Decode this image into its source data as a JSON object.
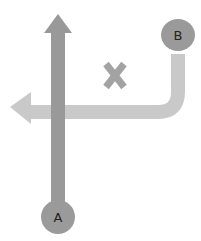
{
  "diagram": {
    "nodes": [
      {
        "id": "A",
        "label": "A",
        "cx": 58,
        "cy": 217,
        "r": 17
      },
      {
        "id": "B",
        "label": "B",
        "cx": 178,
        "cy": 35,
        "r": 17
      }
    ],
    "paths": [
      {
        "id": "path-a",
        "from": "A",
        "direction": "up",
        "color": "#999999"
      },
      {
        "id": "path-b",
        "from": "B",
        "direction": "down-then-left",
        "color": "#c8c8c8"
      }
    ],
    "marker": {
      "symbol": "x",
      "color": "#a3a3a3"
    },
    "colors": {
      "node_fill": "#9a9a9a",
      "path_a": "#999999",
      "path_b": "#c9c9c9",
      "x_mark": "#a3a3a3",
      "background": "#ffffff"
    }
  }
}
